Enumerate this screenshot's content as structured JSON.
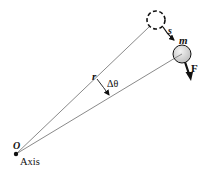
{
  "diagram": {
    "labels": {
      "origin": "O",
      "axis": "Axis",
      "radius": "r",
      "angle": "Δθ",
      "arc_length": "s",
      "mass": "m",
      "force": "F"
    },
    "colors": {
      "line": "#8a8a8a",
      "ink": "#111111",
      "ball_fill": "#d9d9d9",
      "background": "#ffffff"
    },
    "elements": [
      {
        "id": "axis-point",
        "description": "rotation axis at O"
      },
      {
        "id": "initial-position",
        "description": "dashed circle, initial position of mass"
      },
      {
        "id": "final-position",
        "description": "solid sphere, mass m after rotation"
      },
      {
        "id": "radius-line-initial",
        "description": "line from O to initial position"
      },
      {
        "id": "radius-line-final",
        "description": "line from O to final position"
      },
      {
        "id": "angle-arrow",
        "description": "curved arrow indicating Δθ"
      },
      {
        "id": "displacement-arrow",
        "description": "arrow s from initial to final position"
      },
      {
        "id": "force-arrow",
        "description": "force F applied on mass"
      }
    ]
  }
}
